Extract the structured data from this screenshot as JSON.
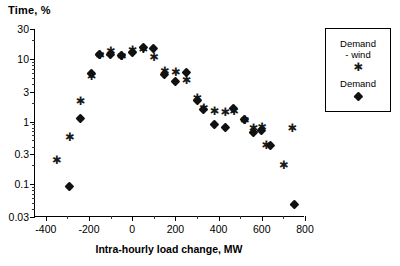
{
  "chart_data": {
    "type": "scatter",
    "title": "",
    "ylabel": "Time, %",
    "xlabel": "Intra-hourly load change, MW",
    "xlim": [
      -450,
      800
    ],
    "ylim": [
      0.03,
      30
    ],
    "yscale": "log",
    "xscale": "linear",
    "grid": false,
    "legend_position": "right-outside",
    "xticks": [
      -400,
      -200,
      0,
      200,
      400,
      600,
      800
    ],
    "xticklabels": [
      "-400",
      "-200",
      "0",
      "200",
      "400",
      "600",
      "800"
    ],
    "yticks": [
      0.03,
      0.1,
      0.3,
      1,
      3,
      10,
      30
    ],
    "yticklabels": [
      "0.03",
      "0.1",
      "0.3",
      "1",
      "3",
      "10",
      "30"
    ],
    "series": [
      {
        "name": "Demand\n- wind",
        "marker": "star",
        "color": "#1a1a1a",
        "points": [
          [
            -350,
            0.24
          ],
          [
            -290,
            0.55
          ],
          [
            -240,
            2.1
          ],
          [
            -190,
            5.2
          ],
          [
            -150,
            11.5
          ],
          [
            -100,
            13.0
          ],
          [
            -50,
            11.0
          ],
          [
            0,
            13.5
          ],
          [
            50,
            14.0
          ],
          [
            100,
            10.5
          ],
          [
            150,
            6.3
          ],
          [
            200,
            6.0
          ],
          [
            250,
            4.6
          ],
          [
            300,
            2.3
          ],
          [
            330,
            1.6
          ],
          [
            380,
            1.45
          ],
          [
            430,
            1.4
          ],
          [
            470,
            1.45
          ],
          [
            520,
            1.05
          ],
          [
            560,
            0.78
          ],
          [
            600,
            0.8
          ],
          [
            620,
            0.42
          ],
          [
            700,
            0.2
          ],
          [
            740,
            0.78
          ]
        ]
      },
      {
        "name": "Demand",
        "marker": "diamond",
        "color": "#111111",
        "points": [
          [
            -290,
            0.092
          ],
          [
            -240,
            1.12
          ],
          [
            -190,
            5.8
          ],
          [
            -150,
            12.0
          ],
          [
            -100,
            12.0
          ],
          [
            -50,
            11.2
          ],
          [
            0,
            12.5
          ],
          [
            50,
            15.0
          ],
          [
            100,
            14.5
          ],
          [
            150,
            5.7
          ],
          [
            200,
            4.3
          ],
          [
            250,
            6.0
          ],
          [
            300,
            2.2
          ],
          [
            330,
            1.55
          ],
          [
            380,
            0.9
          ],
          [
            430,
            0.8
          ],
          [
            470,
            1.6
          ],
          [
            520,
            1.1
          ],
          [
            560,
            0.67
          ],
          [
            600,
            0.72
          ],
          [
            640,
            0.42
          ],
          [
            750,
            0.047
          ]
        ]
      }
    ]
  }
}
